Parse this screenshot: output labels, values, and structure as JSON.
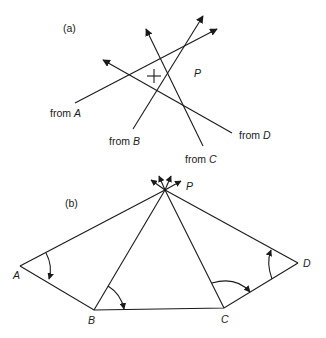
{
  "panels": [
    {
      "id": "a",
      "label": "(a)",
      "point_label": "P",
      "rays": [
        {
          "prefix": "from ",
          "station": "A"
        },
        {
          "prefix": "from ",
          "station": "B"
        },
        {
          "prefix": "from ",
          "station": "C"
        },
        {
          "prefix": "from ",
          "station": "D"
        }
      ],
      "marker": "cross (estimated position)"
    },
    {
      "id": "b",
      "label": "(b)",
      "apex_label": "P",
      "vertices": [
        "A",
        "B",
        "C",
        "D"
      ]
    }
  ]
}
